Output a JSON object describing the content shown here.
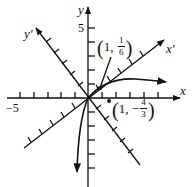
{
  "diagram": {
    "type": "rotated-axes-conic",
    "axes": {
      "x_label": "x",
      "y_label": "y",
      "x_prime_label": "x'",
      "y_prime_label": "y'",
      "tick_x_label": "−5",
      "tick_y_label": "5"
    },
    "points": [
      {
        "label_x": "1",
        "label_num": "1",
        "label_den": "6",
        "sign": "",
        "description": "(1, 1/6)"
      },
      {
        "label_x": "1",
        "label_num": "4",
        "label_den": "3",
        "sign": "−",
        "description": "(1, −4/3)"
      }
    ],
    "colors": {
      "ink": "#111111",
      "background": "#ffffff"
    }
  }
}
